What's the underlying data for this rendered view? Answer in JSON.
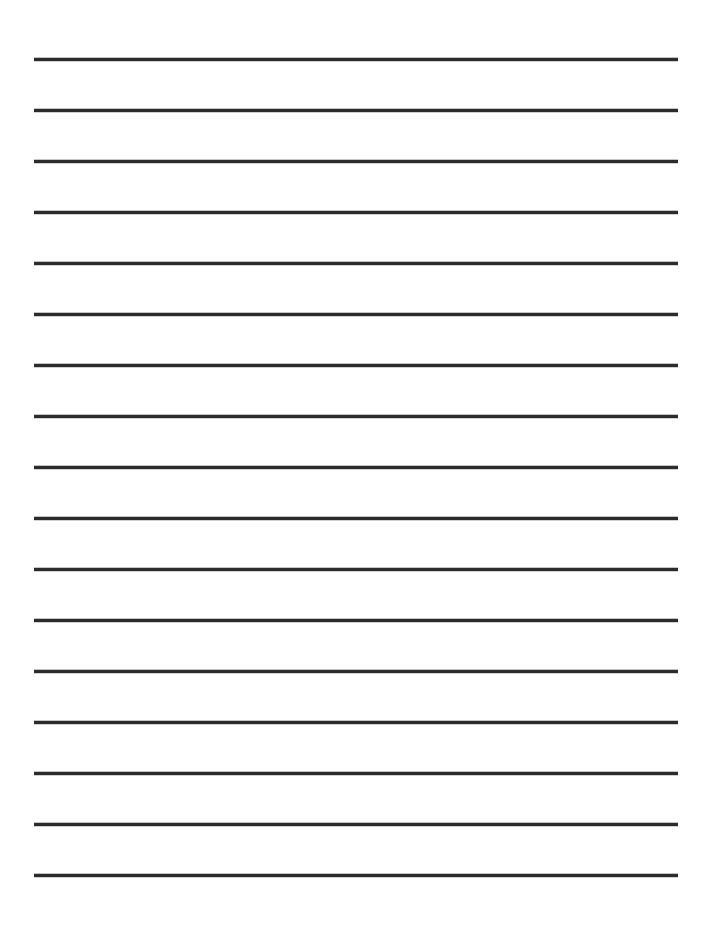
{
  "document": {
    "kind": "lined-writing-paper",
    "title": "",
    "header_text": "",
    "footer_text": "",
    "background_color": "#ffffff",
    "page_width": 712,
    "page_height": 930
  },
  "rules": {
    "count": 17,
    "color": "#2b2b2d",
    "thickness_px": 3,
    "left_px": 34,
    "right_px": 678,
    "length_px": 644,
    "spacing_px": 51,
    "first_line_y_px": 58,
    "y_positions": [
      58,
      109,
      160,
      211,
      262,
      313,
      364,
      415,
      466,
      517,
      568,
      619,
      670,
      721,
      772,
      823,
      874
    ],
    "labels": [
      "line-1",
      "line-2",
      "line-3",
      "line-4",
      "line-5",
      "line-6",
      "line-7",
      "line-8",
      "line-9",
      "line-10",
      "line-11",
      "line-12",
      "line-13",
      "line-14",
      "line-15",
      "line-16",
      "line-17"
    ]
  },
  "margins": {
    "top_px": 58,
    "bottom_px": 56,
    "left_px": 34,
    "right_px": 34
  }
}
